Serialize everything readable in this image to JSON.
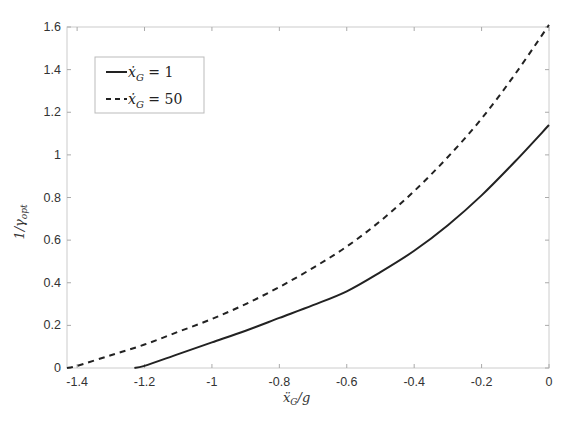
{
  "chart_data": {
    "type": "line",
    "title": "",
    "xlabel": "ẍ_G / g",
    "ylabel": "1 / γ_opt",
    "xlim": [
      -1.43,
      0
    ],
    "ylim": [
      0,
      1.6
    ],
    "grid": false,
    "legend_position": "upper left",
    "xticks": [
      -1.4,
      -1.2,
      -1,
      -0.8,
      -0.6,
      -0.4,
      -0.2,
      0
    ],
    "xtick_labels": [
      "-1.4",
      "-1.2",
      "-1",
      "-0.8",
      "-0.6",
      "-0.4",
      "-0.2",
      "0"
    ],
    "yticks": [
      0,
      0.2,
      0.4,
      0.6,
      0.8,
      1,
      1.2,
      1.4,
      1.6
    ],
    "ytick_labels": [
      "0",
      "0.2",
      "0.4",
      "0.6",
      "0.8",
      "1",
      "1.2",
      "1.4",
      "1.6"
    ],
    "series": [
      {
        "name": "ẋ_G = 1",
        "legend_label": "ẋG = 1",
        "style": "solid",
        "color": "#222222",
        "x": [
          -1.23,
          -1.2,
          -1.1,
          -1.0,
          -0.9,
          -0.8,
          -0.7,
          -0.6,
          -0.5,
          -0.4,
          -0.3,
          -0.2,
          -0.1,
          0
        ],
        "y": [
          0,
          0.01,
          0.065,
          0.12,
          0.175,
          0.235,
          0.295,
          0.36,
          0.45,
          0.55,
          0.67,
          0.81,
          0.97,
          1.14
        ]
      },
      {
        "name": "ẋ_G = 50",
        "legend_label": "ẋG = 50",
        "style": "dashed",
        "color": "#222222",
        "x": [
          -1.43,
          -1.4,
          -1.3,
          -1.2,
          -1.1,
          -1.0,
          -0.9,
          -0.8,
          -0.7,
          -0.6,
          -0.5,
          -0.4,
          -0.3,
          -0.2,
          -0.1,
          0
        ],
        "y": [
          0,
          0.01,
          0.06,
          0.11,
          0.17,
          0.23,
          0.3,
          0.38,
          0.47,
          0.57,
          0.69,
          0.83,
          0.99,
          1.17,
          1.38,
          1.61
        ]
      }
    ]
  },
  "legend": {
    "items": [
      {
        "prefix": "ẋ",
        "sub": "G",
        "rest": " = 1"
      },
      {
        "prefix": "ẋ",
        "sub": "G",
        "rest": " = 50"
      }
    ]
  },
  "axes": {
    "xlabel_main": "ẍ",
    "xlabel_sub": "G",
    "xlabel_rest": "/g",
    "ylabel_main": "1/γ",
    "ylabel_sub": "opt"
  }
}
